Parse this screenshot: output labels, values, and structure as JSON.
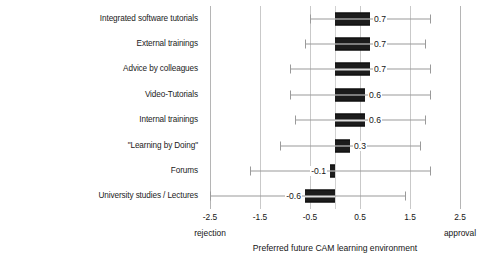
{
  "chart_data": {
    "type": "bar",
    "orientation": "horizontal",
    "title": "",
    "xlabel": "Preferred future CAM learning environment",
    "ylabel": "",
    "xlim": [
      -2.5,
      2.5
    ],
    "xticks": [
      "-2.5",
      "-1.5",
      "-0.5",
      "0.5",
      "1.5",
      "2.5"
    ],
    "xtick_values": [
      -2.5,
      -1.5,
      -0.5,
      0.5,
      1.5,
      2.5
    ],
    "grid": true,
    "legend": null,
    "scale_anchors": {
      "low": "rejection",
      "high": "approval"
    },
    "categories": [
      "Integrated software tutorials",
      "External trainings",
      "Advice by colleagues",
      "Video-Tutorials",
      "Internal trainings",
      "\"Learning by Doing\"",
      "Forums",
      "University studies / Lectures"
    ],
    "values": [
      0.7,
      0.7,
      0.7,
      0.6,
      0.6,
      0.3,
      -0.1,
      -0.6
    ],
    "value_labels": [
      "0.7",
      "0.7",
      "0.7",
      "0.6",
      "0.6",
      "0.3",
      "-0.1",
      "-0.6"
    ],
    "error_low": [
      -0.5,
      -0.6,
      -0.9,
      -0.9,
      -0.8,
      -1.1,
      -1.7,
      -2.5
    ],
    "error_high": [
      1.9,
      1.8,
      1.9,
      1.9,
      1.8,
      1.7,
      1.9,
      1.4
    ]
  }
}
